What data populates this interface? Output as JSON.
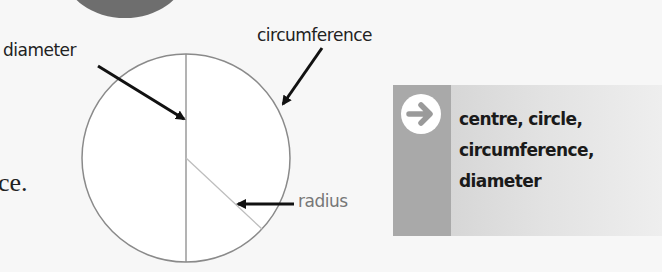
{
  "page": {
    "body_text_fragment": "ce."
  },
  "diagram": {
    "labels": {
      "diameter": "diameter",
      "circumference": "circumference",
      "radius": "radius"
    },
    "colors": {
      "circle_stroke": "#8a8a8a",
      "radius_line": "#bdbdbd",
      "arrow": "#111111",
      "top_disc": "#6e6e6e"
    }
  },
  "key_words_box": {
    "icon": "arrow-right-circle-icon",
    "lines": [
      "centre, circle,",
      "circumference,",
      "diameter"
    ],
    "colors": {
      "strip": "#a9a9a9",
      "background_start": "#cfcfcf",
      "background_end": "#eeeeee"
    }
  }
}
